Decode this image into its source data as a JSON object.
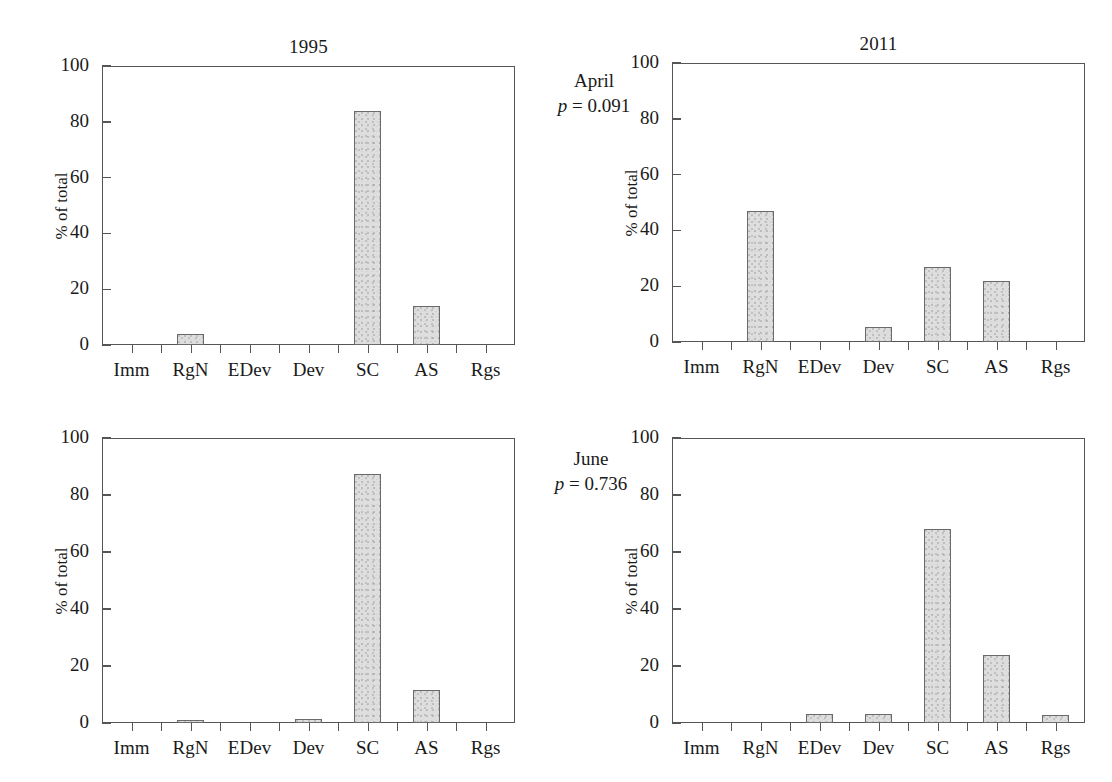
{
  "figure": {
    "column_titles": [
      "1995",
      "2011"
    ],
    "y_axis_label": "% of total",
    "y_ticks": [
      "0",
      "20",
      "40",
      "60",
      "80",
      "100"
    ],
    "categories": [
      "Imm",
      "RgN",
      "EDev",
      "Dev",
      "SC",
      "AS",
      "Rgs"
    ],
    "row_annotations": [
      {
        "month": "April",
        "p_symbol": "p",
        "p_text": " = 0.091"
      },
      {
        "month": "June",
        "p_symbol": "p",
        "p_text": " = 0.736"
      }
    ],
    "colors": {
      "bar_fill": "#dedede",
      "bar_stroke": "#6a6a6a",
      "axis": "#555555",
      "text": "#1a1a1a",
      "background": "#ffffff"
    }
  },
  "chart_data": [
    {
      "type": "bar",
      "title": "1995",
      "panel": "april-1995",
      "row_label": "April",
      "annotation": "p = 0.091",
      "categories": [
        "Imm",
        "RgN",
        "EDev",
        "Dev",
        "SC",
        "AS",
        "Rgs"
      ],
      "values": [
        0,
        4,
        0,
        0,
        84,
        14,
        0
      ],
      "xlabel": "",
      "ylabel": "% of total",
      "ylim": [
        0,
        100
      ],
      "yticks": [
        0,
        20,
        40,
        60,
        80,
        100
      ],
      "grid": false,
      "legend": "none"
    },
    {
      "type": "bar",
      "title": "2011",
      "panel": "april-2011",
      "row_label": "April",
      "annotation": "p = 0.091",
      "categories": [
        "Imm",
        "RgN",
        "EDev",
        "Dev",
        "SC",
        "AS",
        "Rgs"
      ],
      "values": [
        0,
        47,
        0,
        5.5,
        27,
        22,
        0
      ],
      "xlabel": "",
      "ylabel": "% of total",
      "ylim": [
        0,
        100
      ],
      "yticks": [
        0,
        20,
        40,
        60,
        80,
        100
      ],
      "grid": false,
      "legend": "none"
    },
    {
      "type": "bar",
      "title": "1995",
      "panel": "june-1995",
      "row_label": "June",
      "annotation": "p = 0.736",
      "categories": [
        "Imm",
        "RgN",
        "EDev",
        "Dev",
        "SC",
        "AS",
        "Rgs"
      ],
      "values": [
        0,
        1,
        0,
        1.5,
        87.5,
        11.5,
        0
      ],
      "xlabel": "",
      "ylabel": "% of total",
      "ylim": [
        0,
        100
      ],
      "yticks": [
        0,
        20,
        40,
        60,
        80,
        100
      ],
      "grid": false,
      "legend": "none"
    },
    {
      "type": "bar",
      "title": "2011",
      "panel": "june-2011",
      "row_label": "June",
      "annotation": "p = 0.736",
      "categories": [
        "Imm",
        "RgN",
        "EDev",
        "Dev",
        "SC",
        "AS",
        "Rgs"
      ],
      "values": [
        0,
        0,
        3.3,
        3.3,
        68,
        24,
        2.7
      ],
      "xlabel": "",
      "ylabel": "% of total",
      "ylim": [
        0,
        100
      ],
      "yticks": [
        0,
        20,
        40,
        60,
        80,
        100
      ],
      "grid": false,
      "legend": "none"
    }
  ]
}
